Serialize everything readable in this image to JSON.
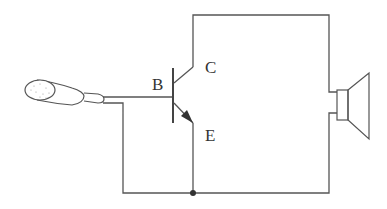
{
  "diagram": {
    "labels": {
      "base": "B",
      "collector": "C",
      "emitter": "E"
    },
    "components": [
      {
        "name": "microphone",
        "icon": "microphone-icon"
      },
      {
        "name": "NPN transistor",
        "icon": "transistor-icon"
      },
      {
        "name": "loudspeaker",
        "icon": "speaker-icon"
      }
    ],
    "colors": {
      "line": "#555555",
      "junction": "#333333",
      "arrow": "#333333",
      "background": "#ffffff"
    }
  }
}
